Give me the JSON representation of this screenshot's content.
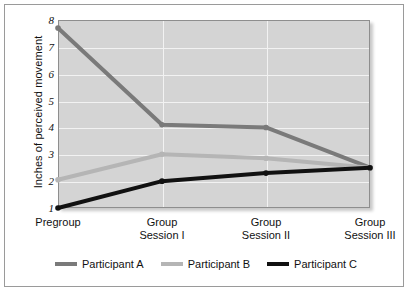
{
  "chart_data": {
    "type": "line",
    "title": "",
    "xlabel": "",
    "ylabel": "Inches of perceived movement",
    "categories": [
      "Pregroup",
      "Group Session I",
      "Group Session II",
      "Group Session III"
    ],
    "category_lines": [
      [
        "Pregroup",
        ""
      ],
      [
        "Group",
        "Session I"
      ],
      [
        "Group",
        "Session II"
      ],
      [
        "Group",
        "Session III"
      ]
    ],
    "yticks": [
      8,
      7,
      6,
      5,
      4,
      3,
      2,
      1
    ],
    "ylim": [
      1,
      8
    ],
    "grid": true,
    "legend_position": "bottom",
    "series": [
      {
        "name": "Participant A",
        "color": "#7a7a7a",
        "values": [
          7.7,
          4.1,
          4.0,
          2.5
        ]
      },
      {
        "name": "Participant B",
        "color": "#b5b5b5",
        "values": [
          2.05,
          3.0,
          2.85,
          2.5
        ]
      },
      {
        "name": "Participant C",
        "color": "#111111",
        "values": [
          1.0,
          2.0,
          2.3,
          2.5
        ]
      }
    ]
  },
  "legend": {
    "items": [
      {
        "label": "Participant A"
      },
      {
        "label": "Participant B"
      },
      {
        "label": "Participant C"
      }
    ]
  }
}
